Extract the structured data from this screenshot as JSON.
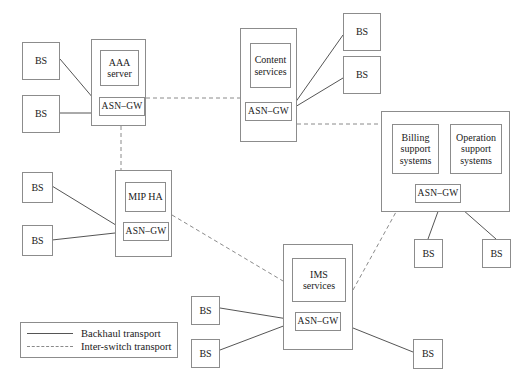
{
  "diagram": {
    "colors": {
      "background": "#ffffff",
      "box_border": "#8c8c8c",
      "solid_link": "#555555",
      "dashed_link": "#8a8a8a",
      "text": "#1a1a1a"
    }
  },
  "legend": {
    "items": [
      {
        "label": "Backhaul transport",
        "style": "solid"
      },
      {
        "label": "Inter-switch transport",
        "style": "dashed"
      }
    ]
  },
  "groups": [
    {
      "id": "aaa-group",
      "service_label": "AAA\nserver",
      "service_line1": "AAA",
      "service_line2": "server",
      "gateway_label": "ASN–GW"
    },
    {
      "id": "content-group",
      "service_line1": "Content",
      "service_line2": "services",
      "gateway_label": "ASN–GW"
    },
    {
      "id": "mipha-group",
      "service_line1": "MIP HA",
      "service_line2": "",
      "gateway_label": "ASN–GW"
    },
    {
      "id": "ims-group",
      "service_line1": "IMS services",
      "service_line2": "",
      "gateway_label": "ASN–GW"
    },
    {
      "id": "oss-group",
      "billing_line1": "Billing",
      "billing_line2": "support",
      "billing_line3": "systems",
      "operation_line1": "Operation",
      "operation_line2": "support",
      "operation_line3": "systems",
      "gateway_label": "ASN–GW"
    }
  ],
  "base_stations": [
    {
      "id": "bs-aaa-1",
      "label": "BS"
    },
    {
      "id": "bs-aaa-2",
      "label": "BS"
    },
    {
      "id": "bs-content-1",
      "label": "BS"
    },
    {
      "id": "bs-content-2",
      "label": "BS"
    },
    {
      "id": "bs-mipha-1",
      "label": "BS"
    },
    {
      "id": "bs-mipha-2",
      "label": "BS"
    },
    {
      "id": "bs-oss-1",
      "label": "BS"
    },
    {
      "id": "bs-oss-2",
      "label": "BS"
    },
    {
      "id": "bs-ims-1",
      "label": "BS"
    },
    {
      "id": "bs-ims-2",
      "label": "BS"
    },
    {
      "id": "bs-ims-3",
      "label": "BS"
    }
  ]
}
